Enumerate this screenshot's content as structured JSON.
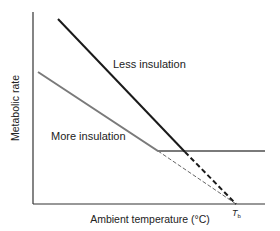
{
  "figure": {
    "y_axis_label": "Metabolic rate",
    "x_axis_label": "Ambient temperature (°C)",
    "tb_label": "T",
    "tb_subscript": "b",
    "series": [
      {
        "name": "Less insulation",
        "color": "#1a1a1a",
        "style": "solid then dashed"
      },
      {
        "name": "More insulation",
        "color": "#7a7a7a",
        "style": "sloped then flat, thin dashed extrapolation"
      }
    ]
  }
}
